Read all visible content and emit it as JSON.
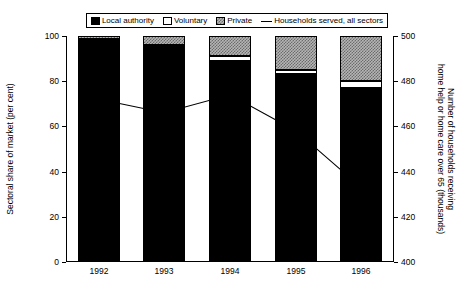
{
  "legend": {
    "items": [
      {
        "label": "Local authority",
        "icon": "filled-square-black-icon",
        "swatch": "local"
      },
      {
        "label": "Voluntary",
        "icon": "open-square-white-icon",
        "swatch": "voluntary"
      },
      {
        "label": "Private",
        "icon": "hatched-square-grey-icon",
        "swatch": "private"
      },
      {
        "label": "Households served, all sectors",
        "icon": "line-sample-icon",
        "swatch": "line"
      }
    ]
  },
  "axes": {
    "left_title": "Sectoral share of market (per cent)",
    "right_title": "Number of households receiving home help or home care over 65 (thousands)",
    "left_ticks": [
      "0",
      "20",
      "40",
      "60",
      "80",
      "100"
    ],
    "right_ticks": [
      "400",
      "420",
      "440",
      "460",
      "480",
      "500"
    ]
  },
  "colors": {
    "local_authority": "#000000",
    "voluntary": "#ffffff",
    "private": "#b5b5b5",
    "line": "#000000",
    "axis": "#000000",
    "background": "#ffffff"
  },
  "chart_data": {
    "type": "bar",
    "title": "",
    "subtitle": "",
    "xlabel": "",
    "ylabel": "Sectoral share of market (per cent)",
    "y2label": "Number of households receiving home help or home care over 65 (thousands)",
    "categories": [
      "1992",
      "1993",
      "1994",
      "1995",
      "1996"
    ],
    "ylim": [
      0,
      100
    ],
    "y2lim": [
      400,
      500
    ],
    "grid": false,
    "legend_position": "top",
    "stacked": true,
    "series": [
      {
        "name": "Local authority",
        "type": "bar",
        "axis": "left",
        "values": [
          98,
          95,
          89,
          83,
          77
        ]
      },
      {
        "name": "Voluntary",
        "type": "bar",
        "axis": "left",
        "values": [
          0.5,
          1,
          2,
          2,
          3
        ]
      },
      {
        "name": "Private",
        "type": "bar",
        "axis": "left",
        "values": [
          1.5,
          4,
          9,
          15,
          20
        ]
      },
      {
        "name": "Households served, all sectors",
        "type": "line",
        "axis": "right",
        "values": [
          472,
          466,
          474,
          458,
          433
        ]
      }
    ]
  }
}
